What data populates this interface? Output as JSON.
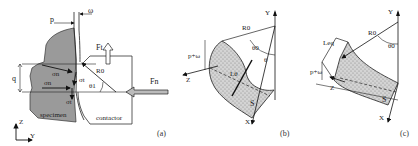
{
  "figure": {
    "panels": [
      {
        "id": "a",
        "caption": "(a)",
        "labels": {
          "p": "p",
          "omega": "ω",
          "q": "q",
          "sigma_n_top": "σn",
          "sigma_n_bottom": "σn",
          "sigma_t_top": "σt",
          "sigma_t_bottom": "σt",
          "theta1": "θ1",
          "R0": "R0",
          "Ft": "Ft",
          "Fn": "Fn",
          "specimen": "specimen",
          "contactor": "contactor",
          "axis_z": "Z",
          "axis_y": "Y"
        }
      },
      {
        "id": "b",
        "caption": "(b)",
        "labels": {
          "axis_y": "Y",
          "axis_z": "Z",
          "axis_x": "X",
          "R0": "R0",
          "theta0": "θ0",
          "theta": "θ",
          "p_plus_omega": "p+ω",
          "L_theta": "Lθ",
          "S": "S"
        }
      },
      {
        "id": "c",
        "caption": "(c)",
        "labels": {
          "axis_y": "Y",
          "axis_z": "Z",
          "axis_x": "X",
          "R0": "R0",
          "theta0": "θ0",
          "p_plus_omega": "p+ω",
          "L_eq": "Leq",
          "S": "S"
        }
      }
    ],
    "colors": {
      "specimen_fill": "#9a9a9a",
      "hatch_fill": "#c8c8c8",
      "line": "#222222",
      "background": "#ffffff"
    }
  }
}
